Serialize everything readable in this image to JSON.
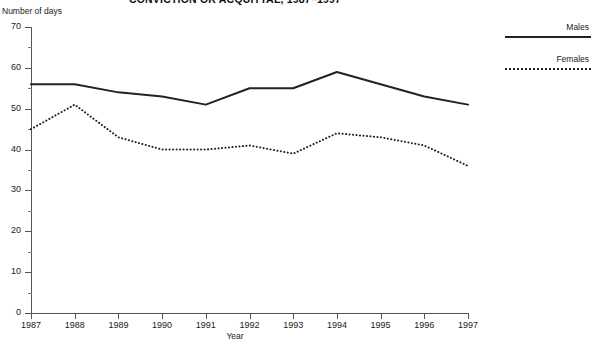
{
  "chart_data": {
    "type": "line",
    "title": "CONVICTION OR ACQUITTAL, 1987–1997",
    "xlabel": "Year",
    "ylabel": "Number of days",
    "categories": [
      "1987",
      "1988",
      "1989",
      "1990",
      "1991",
      "1992",
      "1993",
      "1994",
      "1995",
      "1996",
      "1997"
    ],
    "x": [
      1987,
      1988,
      1989,
      1990,
      1991,
      1992,
      1993,
      1994,
      1995,
      1996,
      1997
    ],
    "xlim": [
      1987,
      1997
    ],
    "ylim": [
      0,
      70
    ],
    "ytick_step": 10,
    "yticks": [
      0,
      10,
      20,
      30,
      40,
      50,
      60,
      70
    ],
    "ytick_labels": [
      "0",
      "10",
      "20",
      "30",
      "40",
      "50",
      "60",
      "70"
    ],
    "yminor_ticks": [
      5,
      15,
      25,
      35,
      45,
      55,
      65
    ],
    "grid": false,
    "legend_position": "right",
    "series": [
      {
        "name": "Males",
        "style": "solid",
        "color": "#222222",
        "values": [
          56,
          56,
          54,
          53,
          51,
          55,
          55,
          59,
          56,
          53,
          51
        ]
      },
      {
        "name": "Females",
        "style": "dotted",
        "color": "#222222",
        "values": [
          45,
          51,
          43,
          40,
          40,
          41,
          39,
          44,
          43,
          41,
          36
        ]
      }
    ]
  },
  "legend": {
    "items": [
      {
        "label": "Males"
      },
      {
        "label": "Females"
      }
    ]
  }
}
